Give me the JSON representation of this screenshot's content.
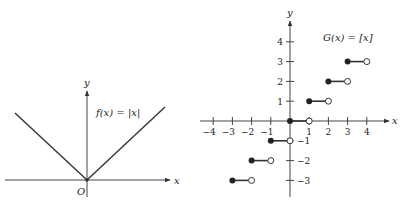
{
  "chart_data": [
    {
      "type": "line",
      "title": "f(x) = |x|",
      "function": "absolute value",
      "xlabel": "x",
      "ylabel": "y",
      "origin_label": "O",
      "points": [
        [
          -1,
          1
        ],
        [
          0,
          0
        ],
        [
          1,
          1
        ]
      ],
      "grid": false,
      "color": "#333333"
    },
    {
      "type": "scatter",
      "title": "G(x) = [x]",
      "function": "greatest integer (step)",
      "xlabel": "x",
      "ylabel": "y",
      "xlim": [
        -4.5,
        4.8
      ],
      "ylim": [
        -3.6,
        4.8
      ],
      "x_ticks": [
        -4,
        -3,
        -2,
        -1,
        1,
        2,
        3,
        4
      ],
      "y_ticks": [
        -3,
        -2,
        -1,
        1,
        2,
        3,
        4
      ],
      "steps": [
        {
          "x_start": -3,
          "x_end": -2,
          "y": -3
        },
        {
          "x_start": -2,
          "x_end": -1,
          "y": -2
        },
        {
          "x_start": -1,
          "x_end": 0,
          "y": -1
        },
        {
          "x_start": 0,
          "x_end": 1,
          "y": 0
        },
        {
          "x_start": 1,
          "x_end": 2,
          "y": 1
        },
        {
          "x_start": 2,
          "x_end": 3,
          "y": 2
        },
        {
          "x_start": 3,
          "x_end": 4,
          "y": 3
        }
      ],
      "closed_endpoint": "left",
      "open_endpoint": "right",
      "grid": false,
      "color": "#333333"
    }
  ]
}
